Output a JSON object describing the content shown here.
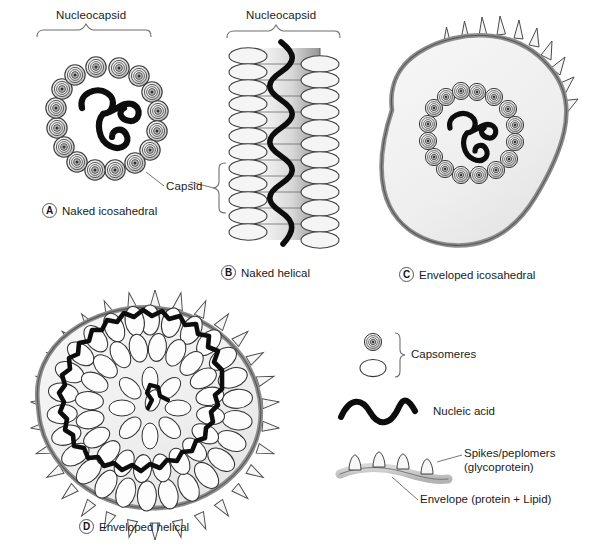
{
  "figure": {
    "title_implied": "Structural forms of viruses",
    "background_color": "#ffffff",
    "ink_color": "#1a1a1a",
    "envelope_fill": "#f0f0f0",
    "envelope_stroke": "#8c8c8c",
    "capsomere_fill": "#f2f2f2"
  },
  "brackets": [
    {
      "label": "Nucleocapsid",
      "panel": "A"
    },
    {
      "label": "Nucleocapsid",
      "panel": "B"
    }
  ],
  "callouts": [
    {
      "label": "Capsid",
      "panel": "A"
    }
  ],
  "panels": [
    {
      "key": "A",
      "tag": "A",
      "label": "Naked icosahedral"
    },
    {
      "key": "B",
      "tag": "B",
      "label": "Naked helical"
    },
    {
      "key": "C",
      "tag": "C",
      "label": "Enveloped icosahedral"
    },
    {
      "key": "D",
      "tag": "D",
      "label": "Enveloped helical"
    }
  ],
  "legend": {
    "items": [
      {
        "key": "capsomeres",
        "label": "Capsomeres",
        "symbol": "capsomere-pair-icon"
      },
      {
        "key": "nucleic_acid",
        "label": "Nucleic acid",
        "symbol": "wavy-line-icon"
      },
      {
        "key": "spikes",
        "label": "Spikes/peplomers\n(glycoprotein)",
        "symbol": "spike-icon"
      },
      {
        "key": "envelope",
        "label": "Envelope (protein + Lipid)",
        "symbol": "envelope-band-icon"
      }
    ]
  }
}
